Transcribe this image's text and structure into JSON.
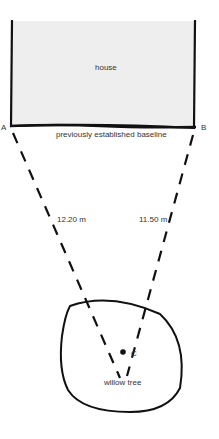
{
  "diagram": {
    "house": {
      "label": "house",
      "fill": "#eeeeee"
    },
    "baseline": {
      "label": "previously established baseline"
    },
    "points": {
      "a": "A",
      "b": "B",
      "c": "C"
    },
    "distances": {
      "ac": "12.20 m",
      "bc": "11.50 m"
    },
    "tree": {
      "label": "willow tree"
    }
  }
}
